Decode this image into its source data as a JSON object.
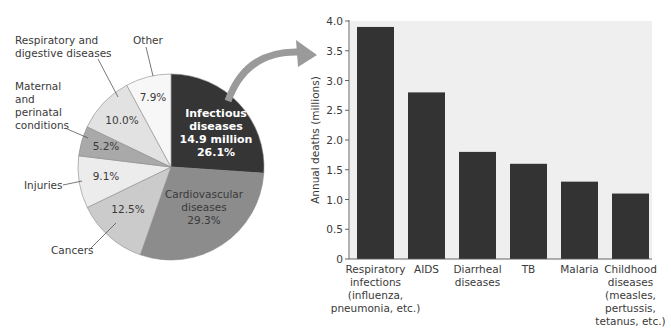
{
  "chart_data": [
    {
      "type": "pie",
      "title": "",
      "start_angle": "12 o'clock, clockwise",
      "slices": [
        {
          "label": "Infectious diseases",
          "detail": "14.9 million",
          "value": 26.1,
          "pct_label": "26.1%",
          "color": "#353535"
        },
        {
          "label": "Cardiovascular diseases",
          "value": 29.3,
          "pct_label": "29.3%",
          "color": "#8c8c8c"
        },
        {
          "label": "Cancers",
          "value": 12.5,
          "pct_label": "12.5%",
          "color": "#cbcbcb"
        },
        {
          "label": "Injuries",
          "value": 9.1,
          "pct_label": "9.1%",
          "color": "#ececec"
        },
        {
          "label": "Maternal and perinatal conditions",
          "value": 5.2,
          "pct_label": "5.2%",
          "color": "#a9a9a9"
        },
        {
          "label": "Respiratory and digestive diseases",
          "value": 10.0,
          "pct_label": "10.0%",
          "color": "#e2e2e2"
        },
        {
          "label": "Other",
          "value": 7.9,
          "pct_label": "7.9%",
          "color": "#f7f7f7"
        }
      ],
      "text": {
        "infectious_line1": "Infectious",
        "infectious_line2": "diseases",
        "infectious_line3": "14.9 million",
        "infectious_line4": "26.1%",
        "cardio_line1": "Cardiovascular",
        "cardio_line2": "diseases",
        "cardio_line3": "29.3%",
        "cancers_pct": "12.5%",
        "injuries_pct": "9.1%",
        "maternal_pct": "5.2%",
        "resp_pct": "10.0%",
        "other_pct": "7.9%",
        "callout_resp_line1": "Respiratory and",
        "callout_resp_line2": "digestive diseases",
        "callout_other": "Other",
        "callout_maternal_line1": "Maternal",
        "callout_maternal_line2": "and",
        "callout_maternal_line3": "perinatal",
        "callout_maternal_line4": "conditions",
        "callout_injuries": "Injuries",
        "callout_cancers": "Cancers"
      }
    },
    {
      "type": "bar",
      "title": "",
      "xlabel": "",
      "ylabel": "Annual deaths (millions)",
      "ylim": [
        0,
        4.0
      ],
      "yticks": [
        "0",
        "0.5",
        "1.0",
        "1.5",
        "2.0",
        "2.5",
        "3.0",
        "3.5",
        "4.0"
      ],
      "grid": false,
      "background": "#efefef",
      "bar_color": "#333333",
      "categories": [
        "Respiratory infections (influenza, pneumonia, etc.)",
        "AIDS",
        "Diarrheal diseases",
        "TB",
        "Malaria",
        "Childhood diseases (measles, pertussis, tetanus, etc.)"
      ],
      "category_lines": [
        [
          "Respiratory",
          "infections",
          "(influenza,",
          "pneumonia, etc.)"
        ],
        [
          "AIDS"
        ],
        [
          "Diarrheal",
          "diseases"
        ],
        [
          "TB"
        ],
        [
          "Malaria"
        ],
        [
          "Childhood",
          "diseases",
          "(measles,",
          "pertussis,",
          "tetanus, etc.)"
        ]
      ],
      "values": [
        3.9,
        2.8,
        1.8,
        1.6,
        1.3,
        1.1
      ]
    }
  ],
  "arrow": {
    "from": "Infectious diseases slice",
    "to": "bar chart",
    "color": "#9a9a9a"
  }
}
